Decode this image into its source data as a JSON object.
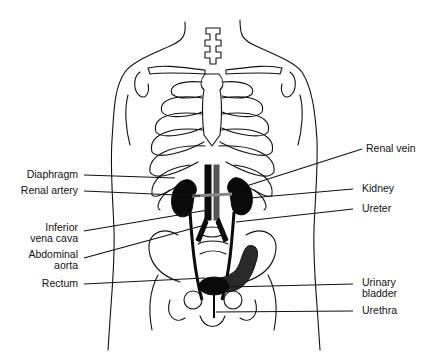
{
  "diagram": {
    "colors": {
      "line": "#111111",
      "organ_fill": "#0a0a0a",
      "background": "#ffffff"
    },
    "labels_left": [
      {
        "id": "diaphragm",
        "text": "Diaphragm"
      },
      {
        "id": "renal-artery",
        "text": "Renal artery"
      },
      {
        "id": "inferior-vena-cava",
        "line1": "Inferior",
        "line2": "vena cava"
      },
      {
        "id": "abdominal-aorta",
        "line1": "Abdominal",
        "line2": "aorta"
      },
      {
        "id": "rectum",
        "text": "Rectum"
      }
    ],
    "labels_right": [
      {
        "id": "renal-vein",
        "text": "Renal vein"
      },
      {
        "id": "kidney",
        "text": "Kidney"
      },
      {
        "id": "ureter",
        "text": "Ureter"
      },
      {
        "id": "urinary-bladder",
        "line1": "Urinary",
        "line2": "bladder"
      },
      {
        "id": "urethra",
        "text": "Urethra"
      }
    ]
  }
}
